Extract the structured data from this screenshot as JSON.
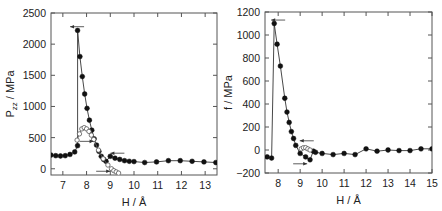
{
  "chart_data": [
    {
      "type": "line",
      "title": "",
      "xlabel": "H / Å",
      "ylabel": "P_zz / MPa",
      "ylabel_main": "P",
      "ylabel_sub": "zz",
      "ylabel_rest": " / MPa",
      "xlim": [
        6.5,
        13.5
      ],
      "ylim": [
        -100,
        2500
      ],
      "xticks": [
        7,
        8,
        9,
        10,
        11,
        12,
        13
      ],
      "yticks": [
        0,
        500,
        1000,
        1500,
        2000,
        2500
      ],
      "grid": false,
      "series": [
        {
          "name": "filled (approach/retract)",
          "marker": "filled-circle",
          "x": [
            6.5,
            6.7,
            6.9,
            7.1,
            7.3,
            7.5,
            7.62,
            7.62,
            7.72,
            7.82,
            7.92,
            8.02,
            8.12,
            8.22,
            8.32,
            8.42,
            8.52,
            8.62,
            8.72,
            8.82,
            9.0,
            9.2,
            9.4,
            9.6,
            9.8,
            10.0,
            10.45,
            10.95,
            11.45,
            11.95,
            12.45,
            12.95,
            13.45
          ],
          "y": [
            220,
            210,
            205,
            210,
            230,
            270,
            370,
            2220,
            1800,
            1480,
            1200,
            970,
            780,
            620,
            480,
            380,
            280,
            200,
            150,
            120,
            200,
            170,
            150,
            130,
            120,
            115,
            100,
            110,
            130,
            130,
            120,
            110,
            100
          ]
        },
        {
          "name": "open (hysteresis branch)",
          "marker": "open-circle",
          "x": [
            7.6,
            7.7,
            7.8,
            7.9,
            8.0,
            8.1,
            8.2,
            8.3,
            8.5,
            8.7,
            8.9,
            9.05,
            9.15,
            9.25,
            9.35
          ],
          "y": [
            460,
            560,
            640,
            660,
            640,
            600,
            540,
            470,
            300,
            160,
            60,
            0,
            -30,
            -50,
            -70
          ]
        }
      ],
      "annotations": [
        {
          "type": "arrow-left",
          "x": 7.6,
          "y": 2280
        },
        {
          "type": "arrow-right",
          "x": 8.0,
          "y": 440
        },
        {
          "type": "arrow-left",
          "x": 9.3,
          "y": 250
        },
        {
          "type": "arrow-right",
          "x": 8.7,
          "y": -40
        }
      ]
    },
    {
      "type": "line",
      "title": "",
      "xlabel": "H / Å",
      "ylabel": "f / MPa",
      "xlim": [
        7.4,
        15
      ],
      "ylim": [
        -200,
        1200
      ],
      "xticks": [
        8,
        9,
        10,
        11,
        12,
        13,
        14,
        15
      ],
      "yticks": [
        -200,
        0,
        200,
        400,
        600,
        800,
        1000,
        1200
      ],
      "grid": false,
      "series": [
        {
          "name": "filled (approach/retract)",
          "marker": "filled-circle",
          "x": [
            7.5,
            7.7,
            7.82,
            7.95,
            8.1,
            8.3,
            8.4,
            8.5,
            8.6,
            8.7,
            8.8,
            9.0,
            9.25,
            9.45,
            9.6,
            9.7,
            10.0,
            10.5,
            11.0,
            11.5,
            12.0,
            12.5,
            13.0,
            13.5,
            14.0,
            14.5,
            15.0
          ],
          "y": [
            -60,
            -70,
            1100,
            920,
            730,
            450,
            330,
            240,
            160,
            100,
            40,
            -30,
            -60,
            -85,
            -10,
            -20,
            -30,
            -40,
            -30,
            -40,
            10,
            -10,
            0,
            -5,
            -5,
            10,
            10
          ]
        },
        {
          "name": "open (hysteresis branch)",
          "marker": "open-circle",
          "x": [
            9.05,
            9.15,
            9.25,
            9.35,
            9.45
          ],
          "y": [
            10,
            20,
            20,
            10,
            0
          ]
        }
      ],
      "annotations": [
        {
          "type": "arrow-left",
          "x": 8.0,
          "y": 1130
        },
        {
          "type": "arrow-left",
          "x": 9.3,
          "y": 80
        },
        {
          "type": "arrow-right",
          "x": 9.0,
          "y": -120
        }
      ]
    }
  ]
}
